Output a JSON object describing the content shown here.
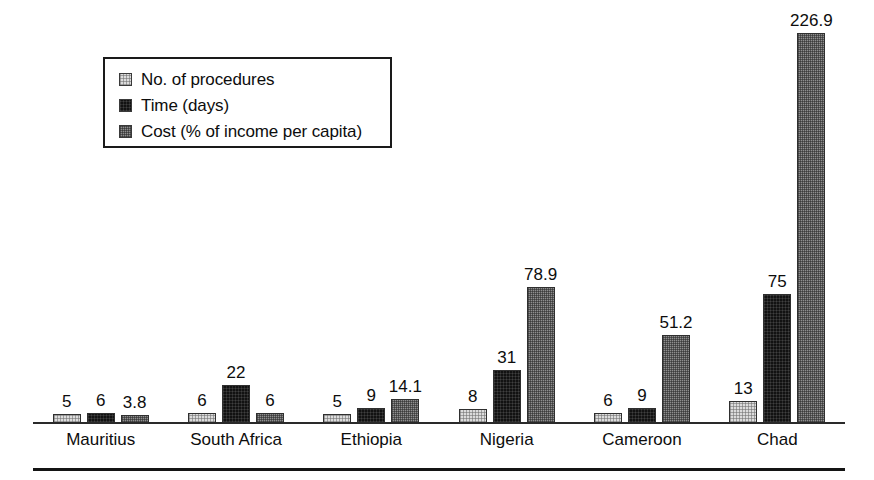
{
  "chart_data": {
    "type": "bar",
    "title": "",
    "subtitle": "",
    "xlabel": "",
    "ylabel": "",
    "grid": false,
    "legend_position": "top-left",
    "ylim": [
      0,
      240
    ],
    "categories": [
      "Mauritius",
      "South Africa",
      "Ethiopia",
      "Nigeria",
      "Cameroon",
      "Chad"
    ],
    "series": [
      {
        "name": "No. of procedures",
        "swatch": "fill-procedures",
        "color": "#dcdcdc",
        "values": [
          5,
          6,
          5,
          8,
          6,
          13
        ],
        "labels": [
          "5",
          "6",
          "5",
          "8",
          "6",
          "13"
        ]
      },
      {
        "name": "Time (days)",
        "swatch": "fill-time",
        "color": "#121212",
        "values": [
          6,
          22,
          9,
          31,
          9,
          75
        ],
        "labels": [
          "6",
          "22",
          "9",
          "31",
          "9",
          "75"
        ]
      },
      {
        "name": "Cost (% of income per capita)",
        "swatch": "fill-cost",
        "color": "#8f8f8f",
        "values": [
          3.8,
          6,
          14.1,
          78.9,
          51.2,
          226.9
        ],
        "labels": [
          "3.8",
          "6",
          "14.1",
          "78.9",
          "51.2",
          "226.9"
        ]
      }
    ]
  },
  "legend": {
    "items": [
      {
        "label": "No. of procedures"
      },
      {
        "label": "Time (days)"
      },
      {
        "label": "Cost (% of income per capita)"
      }
    ]
  },
  "axis": {
    "categories": [
      {
        "label": "Mauritius"
      },
      {
        "label": "South Africa"
      },
      {
        "label": "Ethiopia"
      },
      {
        "label": "Nigeria"
      },
      {
        "label": "Cameroon"
      },
      {
        "label": "Chad"
      }
    ]
  }
}
